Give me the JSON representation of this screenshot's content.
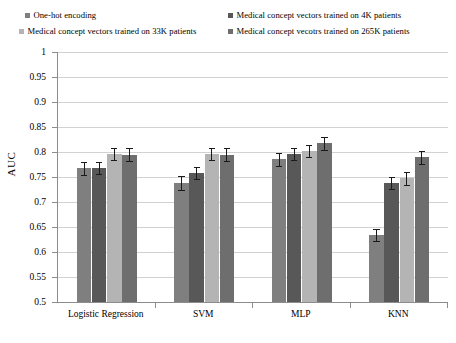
{
  "chart_data": {
    "type": "bar",
    "title": "",
    "subtitle": "",
    "xlabel": "",
    "ylabel": "AUC",
    "ylim": [
      0.5,
      1
    ],
    "ytick_step": 0.05,
    "yticks": [
      "1",
      "0.95",
      "0.9",
      "0.85",
      "0.8",
      "0.75",
      "0.7",
      "0.65",
      "0.6",
      "0.55",
      "0.5"
    ],
    "ytick_values": [
      1,
      0.95,
      0.9,
      0.85,
      0.8,
      0.75,
      0.7,
      0.65,
      0.6,
      0.55,
      0.5
    ],
    "grid": true,
    "grid_axis": "y",
    "legend_position": "top",
    "categories": [
      "Logistic Regression",
      "SVM",
      "MLP",
      "KNN"
    ],
    "series": [
      {
        "name": "One-hot encoding",
        "color": "#7f7f7f",
        "values": [
          0.768,
          0.738,
          0.786,
          0.634
        ],
        "errors": [
          0.013,
          0.014,
          0.013,
          0.012
        ]
      },
      {
        "name": "Medical concept vectors trained on 4K patients",
        "color": "#585858",
        "values": [
          0.768,
          0.758,
          0.796,
          0.738
        ]
      },
      {
        "name": "Medical concept vectors trained on 33K patients",
        "color": "#b4b4b4",
        "values": [
          0.796,
          0.796,
          0.802,
          0.748
        ],
        "errors": [
          0.012,
          0.012,
          0.012,
          0.013
        ]
      },
      {
        "name": "Medical concept vecotrs trained on 265K patients",
        "color": "#6e6e6e",
        "values": [
          0.795,
          0.795,
          0.818,
          0.79
        ],
        "errors": [
          0.013,
          0.013,
          0.013,
          0.013
        ]
      }
    ]
  },
  "colors": {
    "axis": "#8c8c8c",
    "gridline": "#d2d2d2",
    "error_bar": "#1a1a1a",
    "background": "#ffffff",
    "text": "#000000"
  }
}
